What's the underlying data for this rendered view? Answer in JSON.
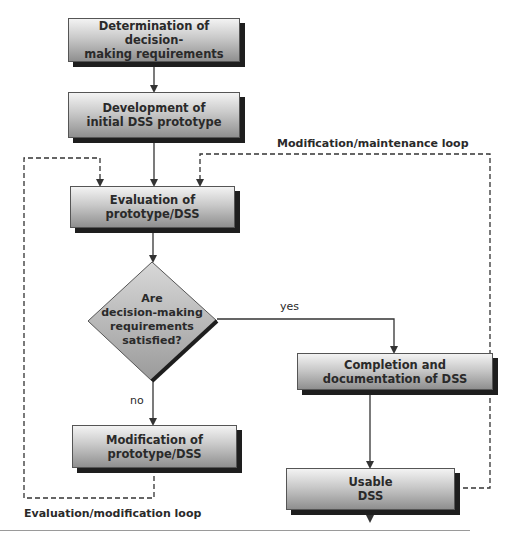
{
  "diagram": {
    "nodes": {
      "determination": {
        "line1": "Determination of decision-",
        "line2": "making requirements"
      },
      "development": {
        "line1": "Development of",
        "line2": "initial DSS prototype"
      },
      "evaluation": {
        "line1": "Evaluation of",
        "line2": "prototype/DSS"
      },
      "decision": {
        "line1": "Are",
        "line2": "decision-making",
        "line3": "requirements",
        "line4": "satisfied?"
      },
      "completion": {
        "line1": "Completion and",
        "line2": "documentation of DSS"
      },
      "modification": {
        "line1": "Modification of",
        "line2": "prototype/DSS"
      },
      "usable": {
        "line1": "Usable",
        "line2": "DSS"
      }
    },
    "edge_labels": {
      "yes": "yes",
      "no": "no"
    },
    "loops": {
      "maintenance": "Modification/maintenance loop",
      "evaluation": "Evaluation/modification loop"
    },
    "colors": {
      "box_light": "#f3f3f3",
      "box_dark": "#8f8f8f",
      "shadow": "#1e1e1e",
      "line": "#333333"
    }
  }
}
